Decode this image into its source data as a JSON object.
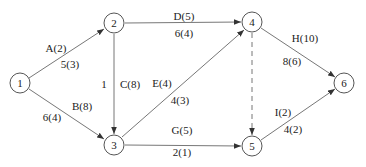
{
  "diagram": {
    "type": "activity-on-arrow network",
    "nodes": [
      {
        "id": "1",
        "label": "1",
        "x": 20,
        "y": 83
      },
      {
        "id": "2",
        "label": "2",
        "x": 114,
        "y": 23
      },
      {
        "id": "3",
        "label": "3",
        "x": 114,
        "y": 145
      },
      {
        "id": "4",
        "label": "4",
        "x": 252,
        "y": 22
      },
      {
        "id": "5",
        "label": "5",
        "x": 252,
        "y": 146
      },
      {
        "id": "6",
        "label": "6",
        "x": 344,
        "y": 83
      }
    ],
    "edges": [
      {
        "from": "1",
        "to": "2",
        "activity": "A(2)",
        "values": "5(3)",
        "dashed": false
      },
      {
        "from": "1",
        "to": "3",
        "activity": "B(8)",
        "values": "6(4)",
        "dashed": false
      },
      {
        "from": "2",
        "to": "3",
        "activity": "C(8)",
        "values": "1",
        "dashed": false
      },
      {
        "from": "2",
        "to": "4",
        "activity": "D(5)",
        "values": "6(4)",
        "dashed": false
      },
      {
        "from": "3",
        "to": "4",
        "activity": "E(4)",
        "values": "4(3)",
        "dashed": false
      },
      {
        "from": "3",
        "to": "5",
        "activity": "G(5)",
        "values": "2(1)",
        "dashed": false
      },
      {
        "from": "4",
        "to": "5",
        "activity": "",
        "values": "",
        "dashed": true
      },
      {
        "from": "4",
        "to": "6",
        "activity": "H(10)",
        "values": "8(6)",
        "dashed": false
      },
      {
        "from": "5",
        "to": "6",
        "activity": "I(2)",
        "values": "4(2)",
        "dashed": false
      }
    ]
  },
  "labels": {
    "n1": "1",
    "n2": "2",
    "n3": "3",
    "n4": "4",
    "n5": "5",
    "n6": "6",
    "a_top": "A(2)",
    "a_bot": "5(3)",
    "b_top": "B(8)",
    "b_bot": "6(4)",
    "c_right": "C(8)",
    "c_left": "1",
    "d_top": "D(5)",
    "d_bot": "6(4)",
    "e_top": "E(4)",
    "e_bot": "4(3)",
    "g_top": "G(5)",
    "g_bot": "2(1)",
    "h_top": "H(10)",
    "h_bot": "8(6)",
    "i_top": "I(2)",
    "i_bot": "4(2)"
  }
}
